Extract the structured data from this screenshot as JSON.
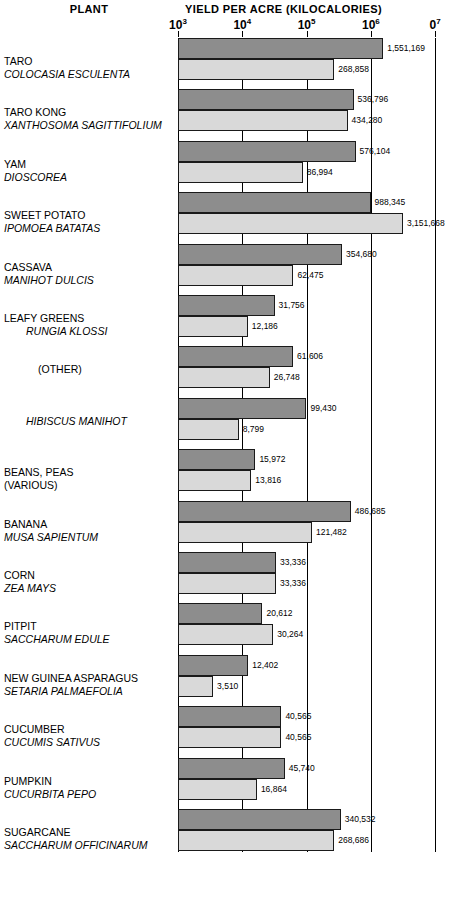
{
  "headers": {
    "plant": "PLANT",
    "yield": "YIELD PER ACRE  (KILOCALORIES)"
  },
  "axis": {
    "ticks": [
      {
        "label": "10",
        "exp": "3",
        "value": 1000
      },
      {
        "label": "10",
        "exp": "4",
        "value": 10000
      },
      {
        "label": "10",
        "exp": "5",
        "value": 100000
      },
      {
        "label": "10",
        "exp": "6",
        "value": 1000000
      },
      {
        "label": "0",
        "exp": "7",
        "value": 10000000
      }
    ]
  },
  "chart_data": {
    "type": "bar",
    "orientation": "horizontal",
    "scale": "log",
    "title": "YIELD PER ACRE  (KILOCALORIES)",
    "xlabel": "YIELD PER ACRE (KILOCALORIES)",
    "ylabel": "PLANT",
    "xlim": [
      1000,
      10000000
    ],
    "grid": true,
    "legend": false,
    "series": [
      {
        "name": "dark",
        "color": "#8d8d8d"
      },
      {
        "name": "light",
        "color": "#d9d9d9"
      }
    ],
    "categories": [
      "TARO",
      "TARO KONG",
      "YAM",
      "SWEET POTATO",
      "CASSAVA",
      "LEAFY GREENS",
      "(OTHER)",
      "HIBISCUS MANIHOT",
      "BEANS, PEAS (VARIOUS)",
      "BANANA",
      "CORN",
      "PITPIT",
      "NEW GUINEA ASPARAGUS",
      "CUCUMBER",
      "PUMPKIN",
      "SUGARCANE"
    ],
    "rows": [
      {
        "common": "TARO",
        "sci": "COLOCASIA ESCULENTA",
        "common_indent": 0,
        "sci_indent": 0,
        "dark": 1551169,
        "light": 268858,
        "dark_text": "1,551,169",
        "light_text": "268,858"
      },
      {
        "common": "TARO KONG",
        "sci": "XANTHOSOMA SAGITTIFOLIUM",
        "common_indent": 0,
        "sci_indent": 0,
        "dark": 536796,
        "light": 434280,
        "dark_text": "536,796",
        "light_text": "434,280"
      },
      {
        "common": "YAM",
        "sci": "DIOSCOREA",
        "common_indent": 0,
        "sci_indent": 0,
        "dark": 576104,
        "light": 86994,
        "dark_text": "576,104",
        "light_text": "86,994"
      },
      {
        "common": "SWEET POTATO",
        "sci": "IPOMOEA BATATAS",
        "common_indent": 0,
        "sci_indent": 0,
        "dark": 988345,
        "light": 3151668,
        "dark_text": "988,345",
        "light_text": "3,151,668"
      },
      {
        "common": "CASSAVA",
        "sci": "MANIHOT DULCIS",
        "common_indent": 0,
        "sci_indent": 0,
        "dark": 354680,
        "light": 62475,
        "dark_text": "354,680",
        "light_text": "62,475"
      },
      {
        "common": "LEAFY GREENS",
        "sci": "RUNGIA KLOSSI",
        "common_indent": 0,
        "sci_indent": 1,
        "dark": 31756,
        "light": 12186,
        "dark_text": "31,756",
        "light_text": "12,186"
      },
      {
        "common": "(OTHER)",
        "sci": "",
        "common_indent": 1,
        "sci_indent": 0,
        "dark": 61606,
        "light": 26748,
        "dark_text": "61,606",
        "light_text": "26,748"
      },
      {
        "common": "",
        "sci": "HIBISCUS MANIHOT",
        "common_indent": 0,
        "sci_indent": 1,
        "dark": 99430,
        "light": 8799,
        "dark_text": "99,430",
        "light_text": "8,799"
      },
      {
        "common": "BEANS, PEAS",
        "sci": "(VARIOUS)",
        "common_indent": 0,
        "sci_indent": 0,
        "sci_italic": false,
        "dark": 15972,
        "light": 13816,
        "dark_text": "15,972",
        "light_text": "13,816"
      },
      {
        "common": "BANANA",
        "sci": "MUSA SAPIENTUM",
        "common_indent": 0,
        "sci_indent": 0,
        "dark": 486685,
        "light": 121482,
        "dark_text": "486,685",
        "light_text": "121,482"
      },
      {
        "common": "CORN",
        "sci": "ZEA MAYS",
        "common_indent": 0,
        "sci_indent": 0,
        "dark": 33336,
        "light": 33336,
        "dark_text": "33,336",
        "light_text": "33,336"
      },
      {
        "common": "PITPIT",
        "sci": "SACCHARUM EDULE",
        "common_indent": 0,
        "sci_indent": 0,
        "dark": 20612,
        "light": 30264,
        "dark_text": "20,612",
        "light_text": "30,264"
      },
      {
        "common": "NEW GUINEA ASPARAGUS",
        "sci": "SETARIA PALMAEFOLIA",
        "common_indent": 0,
        "sci_indent": 0,
        "dark": 12402,
        "light": 3510,
        "dark_text": "12,402",
        "light_text": "3,510"
      },
      {
        "common": "CUCUMBER",
        "sci": "CUCUMIS SATIVUS",
        "common_indent": 0,
        "sci_indent": 0,
        "dark": 40565,
        "light": 40565,
        "dark_text": "40,565",
        "light_text": "40,565"
      },
      {
        "common": "PUMPKIN",
        "sci": "CUCURBITA PEPO",
        "common_indent": 0,
        "sci_indent": 0,
        "dark": 45740,
        "light": 16864,
        "dark_text": "45,740",
        "light_text": "16,864"
      },
      {
        "common": "SUGARCANE",
        "sci": "SACCHARUM OFFICINARUM",
        "common_indent": 0,
        "sci_indent": 0,
        "dark": 340532,
        "light": 268686,
        "dark_text": "340,532",
        "light_text": "268,686"
      }
    ]
  }
}
